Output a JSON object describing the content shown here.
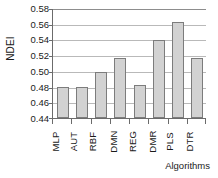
{
  "chart_data": {
    "type": "bar",
    "title": "",
    "xlabel": "Algorithms",
    "ylabel": "NDEI",
    "categories": [
      "MLP",
      "AUT",
      "RBF",
      "DMN",
      "REG",
      "DMR",
      "PLS",
      "DTR"
    ],
    "values": [
      0.48,
      0.479,
      0.499,
      0.516,
      0.482,
      0.539,
      0.562,
      0.516
    ],
    "ylim": [
      0.44,
      0.58
    ],
    "ytick_step": 0.02,
    "ytick_labels": [
      "0.58",
      "0.56",
      "0.54",
      "0.52",
      "0.50",
      "0.48",
      "0.46",
      "0.44"
    ],
    "ytick_values": [
      0.58,
      0.56,
      0.54,
      0.52,
      0.5,
      0.48,
      0.46,
      0.44
    ],
    "grid": true,
    "legend": false,
    "legend_position": "none",
    "bar_fill_color": "#d2d2d2",
    "bar_border_color": "#7c7c7c",
    "grid_color": "#b9b9b9",
    "axis_color": "#6b6b6b",
    "background_color": "#ffffff"
  },
  "axes": {
    "y_title": "NDEI",
    "x_title": "Algorithms"
  }
}
